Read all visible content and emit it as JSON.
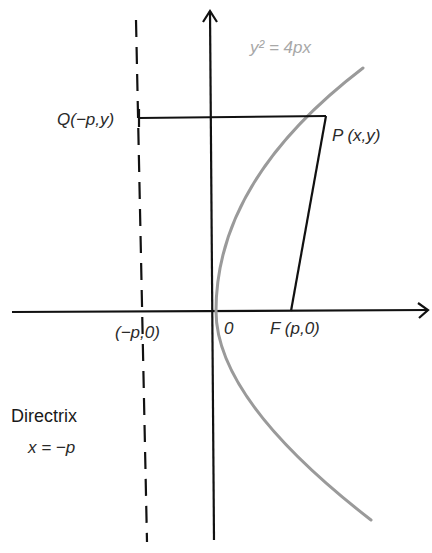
{
  "figure": {
    "equation": "y² = 4px",
    "points": {
      "P": "P (x,y)",
      "Q": "Q(−p,y)",
      "F": "F (p,0)",
      "origin": "0",
      "directrix_intercept": "(−p,0)"
    },
    "directrix": {
      "title": "Directrix",
      "equation": "x = −p"
    },
    "colors": {
      "axis": "#111111",
      "curve": "#9a9a9a",
      "segments": "#111111",
      "equation_text": "#a8a8a8"
    }
  }
}
